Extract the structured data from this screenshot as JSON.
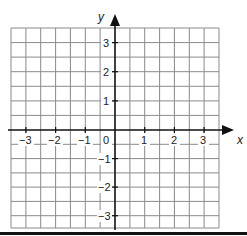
{
  "figure": {
    "type": "coordinate-grid",
    "x_axis": {
      "label": "x",
      "min": -3.5,
      "max": 3.5,
      "tick_labels": [
        "-3",
        "-2",
        "-1",
        "0",
        "1",
        "2",
        "3"
      ],
      "tick_values": [
        -3,
        -2,
        -1,
        0,
        1,
        2,
        3
      ]
    },
    "y_axis": {
      "label": "y",
      "min": -3.5,
      "max": 3.5,
      "tick_labels": [
        "3",
        "2",
        "1",
        "-1",
        "-2",
        "-3"
      ],
      "tick_values": [
        3,
        2,
        1,
        -1,
        -2,
        -3
      ]
    },
    "grid": {
      "columns": 14,
      "rows": 14,
      "cells_per_unit": 2,
      "line_color": "#808080",
      "axis_color": "#111111"
    }
  },
  "labels": {
    "x_axis_name": "x",
    "y_axis_name": "y",
    "origin": "0",
    "x_neg3": "−3",
    "x_neg2": "−2",
    "x_neg1": "−1",
    "x_1": "1",
    "x_2": "2",
    "x_3": "3",
    "y_3": "3",
    "y_2": "2",
    "y_1": "1",
    "y_neg1": "−1",
    "y_neg2": "−2",
    "y_neg3": "−3"
  }
}
